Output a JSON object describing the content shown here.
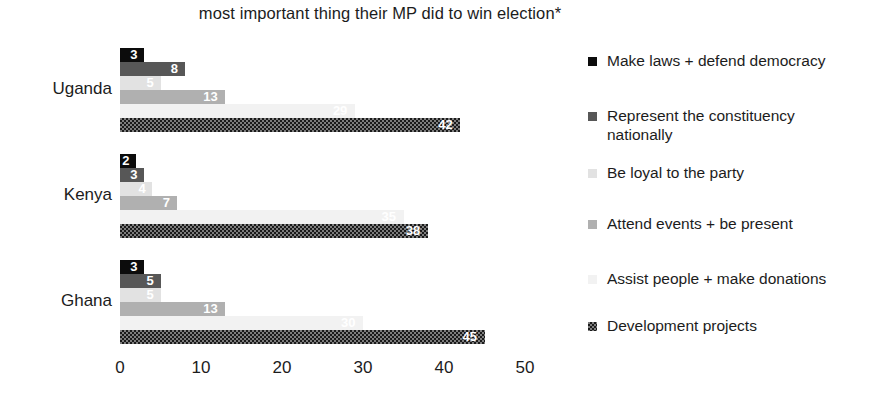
{
  "chart_data": {
    "type": "bar",
    "orientation": "horizontal",
    "title": "most important thing their MP did to win election*",
    "xlabel": "",
    "ylabel": "",
    "xlim": [
      0,
      50
    ],
    "xticks": [
      0,
      10,
      20,
      30,
      40,
      50
    ],
    "grid": false,
    "legend_position": "right",
    "categories": [
      "Uganda",
      "Kenya",
      "Ghana"
    ],
    "series": [
      {
        "name": "Make laws + defend democracy",
        "color": "#0c0c0c",
        "swatch": "solid-black",
        "values": [
          3,
          2,
          3
        ]
      },
      {
        "name": "Represent the constituency nationally",
        "color": "#575757",
        "swatch": "solid-dark-gray",
        "values": [
          8,
          3,
          5
        ]
      },
      {
        "name": "Be loyal to the party",
        "color": "#e2e2e2",
        "swatch": "solid-very-light-gray",
        "values": [
          5,
          4,
          5
        ]
      },
      {
        "name": "Attend events + be present",
        "color": "#b0b0b0",
        "swatch": "solid-mid-gray",
        "values": [
          13,
          7,
          13
        ]
      },
      {
        "name": "Assist people + make donations",
        "color": "#f2f2f2",
        "swatch": "solid-near-white",
        "values": [
          29,
          35,
          30
        ]
      },
      {
        "name": "Development projects",
        "color": "#7d7d7d",
        "swatch": "checkered",
        "values": [
          42,
          38,
          45
        ]
      }
    ]
  },
  "axis": {
    "tick_labels": [
      "0",
      "10",
      "20",
      "30",
      "40",
      "50"
    ]
  }
}
